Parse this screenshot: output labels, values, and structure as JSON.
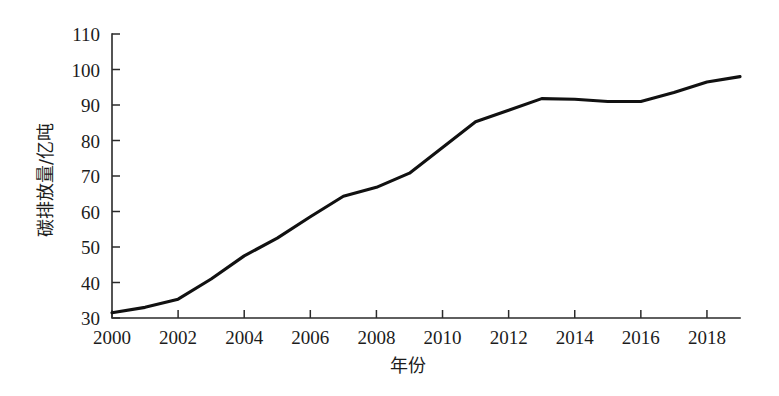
{
  "chart_data": {
    "type": "line",
    "title": "",
    "xlabel": "年份",
    "ylabel": "碳排放量/亿吨",
    "xlim": [
      2000,
      2019
    ],
    "ylim": [
      30,
      110
    ],
    "grid": false,
    "legend": "none",
    "x_ticks": [
      "2000",
      "2002",
      "2004",
      "2006",
      "2008",
      "2010",
      "2012",
      "2014",
      "2016",
      "2018"
    ],
    "y_ticks": [
      "30",
      "40",
      "50",
      "60",
      "70",
      "80",
      "90",
      "100",
      "110"
    ],
    "x_tick_values": [
      2000,
      2002,
      2004,
      2006,
      2008,
      2010,
      2012,
      2014,
      2016,
      2018
    ],
    "y_tick_values": [
      30,
      40,
      50,
      60,
      70,
      80,
      90,
      100,
      110
    ],
    "series": [
      {
        "name": "碳排放量",
        "color": "#111111",
        "x": [
          2000,
          2001,
          2002,
          2003,
          2004,
          2005,
          2006,
          2007,
          2008,
          2009,
          2010,
          2011,
          2012,
          2013,
          2014,
          2015,
          2016,
          2017,
          2018,
          2019
        ],
        "values": [
          31.5,
          33.0,
          35.3,
          41.0,
          47.5,
          52.5,
          58.5,
          64.3,
          66.8,
          70.8,
          78.0,
          85.3,
          88.5,
          91.8,
          91.6,
          91.0,
          91.0,
          93.5,
          96.5,
          98.0
        ]
      }
    ]
  },
  "axis_colors": {
    "axis": "#2b2b2b",
    "line": "#111111",
    "background": "#ffffff"
  }
}
